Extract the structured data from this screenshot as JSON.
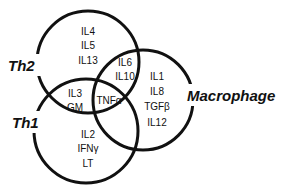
{
  "diagram": {
    "type": "venn",
    "sets": [
      {
        "name": "Th2",
        "label": "Th2"
      },
      {
        "name": "Th1",
        "label": "Th1"
      },
      {
        "name": "Macrophage",
        "label": "Macrophage"
      }
    ],
    "regions": {
      "th2_only": [
        "IL4",
        "IL5",
        "IL13"
      ],
      "th2_macrophage": [
        "IL6",
        "IL10"
      ],
      "th2_th1": [
        "IL3",
        "GM"
      ],
      "all_three": [
        "TNFα"
      ],
      "macrophage_only": [
        "IL1",
        "IL8",
        "TGFβ",
        "IL12"
      ],
      "th1_only": [
        "IL2",
        "IFNγ",
        "LT"
      ]
    },
    "stroke_color": "#111111",
    "background_color": "#ffffff"
  }
}
